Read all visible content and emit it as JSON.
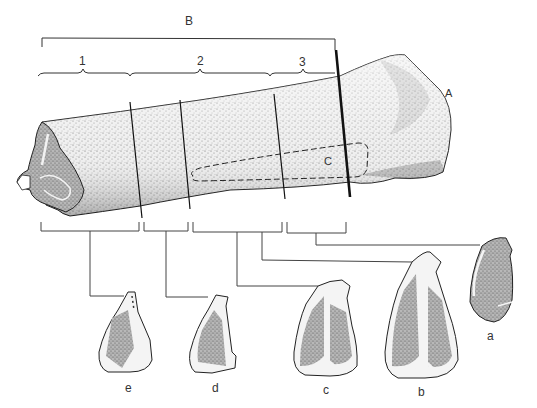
{
  "figure": {
    "type": "anatomical-bone-illustration",
    "labels": {
      "overall_span": "B",
      "end_point": "A",
      "region": "C",
      "segments": [
        "1",
        "2",
        "3"
      ],
      "cross_sections": [
        "a",
        "b",
        "c",
        "d",
        "e"
      ]
    },
    "colors": {
      "ink": "#222222",
      "stipple_light": "#d8d8d8",
      "stipple_dark": "#8a8a8a",
      "section_fill": "#9a9a9a",
      "cortex": "#f4f4f4",
      "background": "#ffffff"
    },
    "cross_sections": [
      {
        "label": "a",
        "order": 1
      },
      {
        "label": "b",
        "order": 2
      },
      {
        "label": "c",
        "order": 3
      },
      {
        "label": "d",
        "order": 4
      },
      {
        "label": "e",
        "order": 5
      }
    ]
  }
}
